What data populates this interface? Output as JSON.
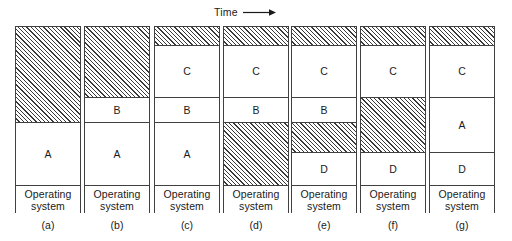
{
  "figure": {
    "time_axis": {
      "label": "Time",
      "arrow_icon": "right-arrow-icon"
    },
    "os_label": "Operating\nsystem",
    "hatch_meaning": "free memory",
    "columns": [
      {
        "id": "a",
        "caption": "(a)",
        "blocks": [
          {
            "label": "",
            "kind": "free",
            "height": 96
          },
          {
            "label": "A",
            "kind": "process",
            "height": 63
          },
          {
            "label": "Operating\nsystem",
            "kind": "os",
            "height": 28
          }
        ]
      },
      {
        "id": "b",
        "caption": "(b)",
        "blocks": [
          {
            "label": "",
            "kind": "free",
            "height": 71
          },
          {
            "label": "B",
            "kind": "process",
            "height": 25
          },
          {
            "label": "A",
            "kind": "process",
            "height": 63
          },
          {
            "label": "Operating\nsystem",
            "kind": "os",
            "height": 28
          }
        ]
      },
      {
        "id": "c",
        "caption": "(c)",
        "blocks": [
          {
            "label": "",
            "kind": "free",
            "height": 19
          },
          {
            "label": "C",
            "kind": "process",
            "height": 52
          },
          {
            "label": "B",
            "kind": "process",
            "height": 25
          },
          {
            "label": "A",
            "kind": "process",
            "height": 63
          },
          {
            "label": "Operating\nsystem",
            "kind": "os",
            "height": 28
          }
        ]
      },
      {
        "id": "d",
        "caption": "(d)",
        "blocks": [
          {
            "label": "",
            "kind": "free",
            "height": 19
          },
          {
            "label": "C",
            "kind": "process",
            "height": 52
          },
          {
            "label": "B",
            "kind": "process",
            "height": 25
          },
          {
            "label": "",
            "kind": "free",
            "height": 63
          },
          {
            "label": "Operating\nsystem",
            "kind": "os",
            "height": 28
          }
        ]
      },
      {
        "id": "e",
        "caption": "(e)",
        "blocks": [
          {
            "label": "",
            "kind": "free",
            "height": 19
          },
          {
            "label": "C",
            "kind": "process",
            "height": 52
          },
          {
            "label": "B",
            "kind": "process",
            "height": 25
          },
          {
            "label": "",
            "kind": "free",
            "height": 30
          },
          {
            "label": "D",
            "kind": "process",
            "height": 33
          },
          {
            "label": "Operating\nsystem",
            "kind": "os",
            "height": 28
          }
        ]
      },
      {
        "id": "f",
        "caption": "(f)",
        "blocks": [
          {
            "label": "",
            "kind": "free",
            "height": 19
          },
          {
            "label": "C",
            "kind": "process",
            "height": 52
          },
          {
            "label": "",
            "kind": "free",
            "height": 55
          },
          {
            "label": "D",
            "kind": "process",
            "height": 33
          },
          {
            "label": "Operating\nsystem",
            "kind": "os",
            "height": 28
          }
        ]
      },
      {
        "id": "g",
        "caption": "(g)",
        "blocks": [
          {
            "label": "",
            "kind": "free",
            "height": 19
          },
          {
            "label": "C",
            "kind": "process",
            "height": 52
          },
          {
            "label": "A",
            "kind": "process",
            "height": 55
          },
          {
            "label": "D",
            "kind": "process",
            "height": 33
          },
          {
            "label": "Operating\nsystem",
            "kind": "os",
            "height": 28
          }
        ]
      }
    ],
    "captions": [
      "(a)",
      "(b)",
      "(c)",
      "(d)",
      "(e)",
      "(f)",
      "(g)"
    ],
    "colors": {
      "stroke": "#404040",
      "hatch": "#3a3a3a",
      "background": "#ffffff",
      "text": "#1a1a1a"
    }
  }
}
